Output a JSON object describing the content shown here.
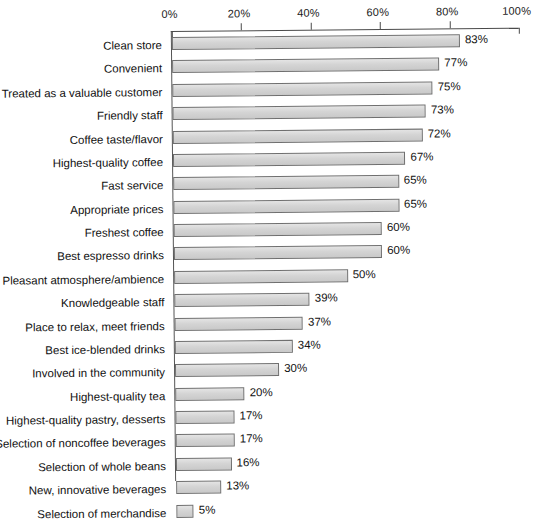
{
  "chart_data": {
    "type": "bar",
    "orientation": "horizontal",
    "title": "",
    "subtitle": "",
    "xlabel": "",
    "ylabel": "",
    "xlim": [
      0,
      100
    ],
    "grid": false,
    "legend": null,
    "value_suffix": "%",
    "axis": {
      "ticks": [
        0,
        20,
        40,
        60,
        80,
        100
      ],
      "tick_labels": [
        "0%",
        "20%",
        "40%",
        "60%",
        "80%",
        "100%"
      ],
      "position": "top"
    },
    "categories": [
      "Clean store",
      "Convenient",
      "Treated as a valuable customer",
      "Friendly staff",
      "Coffee taste/flavor",
      "Highest-quality coffee",
      "Fast service",
      "Appropriate prices",
      "Freshest coffee",
      "Best espresso drinks",
      "Pleasant atmosphere/ambience",
      "Knowledgeable staff",
      "Place to relax, meet friends",
      "Best ice-blended drinks",
      "Involved in the community",
      "Highest-quality tea",
      "Highest-quality pastry, desserts",
      "Selection of noncoffee beverages",
      "Selection of whole beans",
      "New, innovative beverages",
      "Selection of merchandise"
    ],
    "values": [
      83,
      77,
      75,
      73,
      72,
      67,
      65,
      65,
      60,
      60,
      50,
      39,
      37,
      34,
      30,
      20,
      17,
      17,
      16,
      13,
      5
    ],
    "data_labels": [
      "83%",
      "77%",
      "75%",
      "73%",
      "72%",
      "67%",
      "65%",
      "65%",
      "60%",
      "60%",
      "50%",
      "39%",
      "37%",
      "34%",
      "30%",
      "20%",
      "17%",
      "17%",
      "16%",
      "13%",
      "5%"
    ],
    "colors": {
      "bar_fill": "#d4d4d4",
      "bar_border": "#6f6f6f",
      "axis": "#4a4a4a",
      "text": "#111111",
      "background": "#ffffff"
    }
  }
}
